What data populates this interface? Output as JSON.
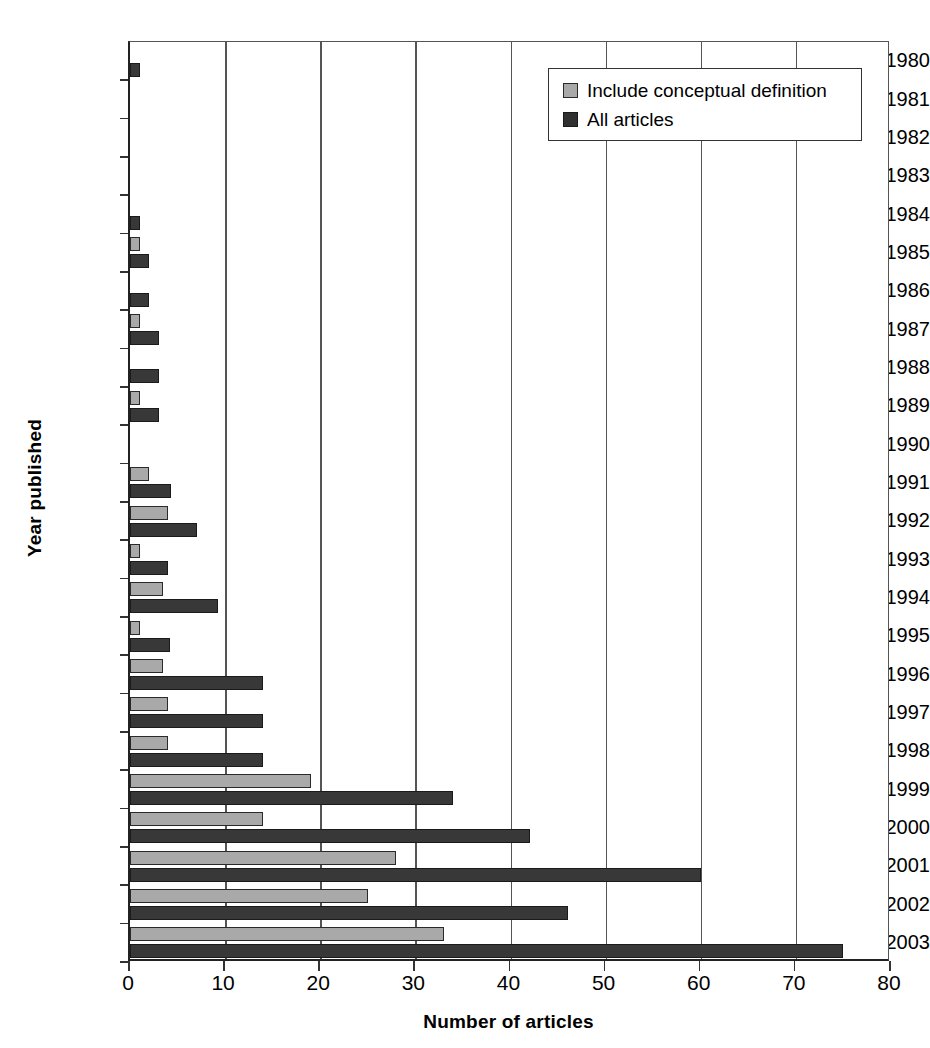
{
  "chart_data": {
    "type": "bar",
    "orientation": "horizontal",
    "title": "",
    "xlabel": "Number of articles",
    "ylabel": "Year published",
    "xlim": [
      0,
      80
    ],
    "xticks": [
      0,
      10,
      20,
      30,
      40,
      50,
      60,
      70,
      80
    ],
    "grid": "vertical",
    "legend_position": "top-right",
    "categories": [
      "1980",
      "1981",
      "1982",
      "1983",
      "1984",
      "1985",
      "1986",
      "1987",
      "1988",
      "1989",
      "1990",
      "1991",
      "1992",
      "1993",
      "1994",
      "1995",
      "1996",
      "1997",
      "1998",
      "1999",
      "2000",
      "2001",
      "2002",
      "2003"
    ],
    "series": [
      {
        "name": "Include conceptual definition",
        "color": "#a9a9a9",
        "values": [
          0,
          0,
          0,
          0,
          0,
          1,
          0,
          1,
          0,
          1,
          0,
          2,
          4,
          1,
          3.5,
          1,
          3.5,
          4,
          4,
          19,
          14,
          28,
          25,
          33
        ]
      },
      {
        "name": "All articles",
        "color": "#383838",
        "values": [
          1,
          0,
          0,
          0,
          1,
          2,
          2,
          3,
          3,
          3,
          0,
          4.3,
          7,
          4,
          9.3,
          4.2,
          14,
          14,
          14,
          34,
          42,
          60,
          46,
          75
        ]
      }
    ]
  },
  "legend": {
    "entries": [
      {
        "label": "Include conceptual definition",
        "swatch": "light"
      },
      {
        "label": "All articles",
        "swatch": "dark"
      }
    ]
  }
}
